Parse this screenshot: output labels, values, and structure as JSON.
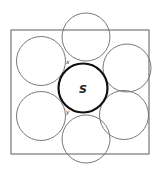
{
  "diagram": {
    "title": "",
    "square": {
      "x": 11,
      "y": 30,
      "width": 138,
      "height": 124,
      "stroke": "#777777"
    },
    "center_circle": {
      "cx": 83,
      "cy": 88,
      "r": 24.5,
      "label": "S",
      "stroke": "#111111"
    },
    "outer_circles": [
      {
        "id": "top",
        "cx": 86,
        "cy": 37,
        "r": 24
      },
      {
        "id": "upper-right",
        "cx": 127,
        "cy": 68,
        "r": 24
      },
      {
        "id": "lower-right",
        "cx": 124,
        "cy": 115,
        "r": 24.5
      },
      {
        "id": "bottom",
        "cx": 86,
        "cy": 139,
        "r": 24
      },
      {
        "id": "lower-left",
        "cx": 41,
        "cy": 116,
        "r": 24.5
      },
      {
        "id": "upper-left",
        "cx": 41,
        "cy": 61,
        "r": 24.5
      }
    ],
    "small_labels": [
      {
        "text": "x",
        "x": 66,
        "y": 64
      },
      {
        "text": "y",
        "x": 66,
        "y": 114
      }
    ]
  }
}
